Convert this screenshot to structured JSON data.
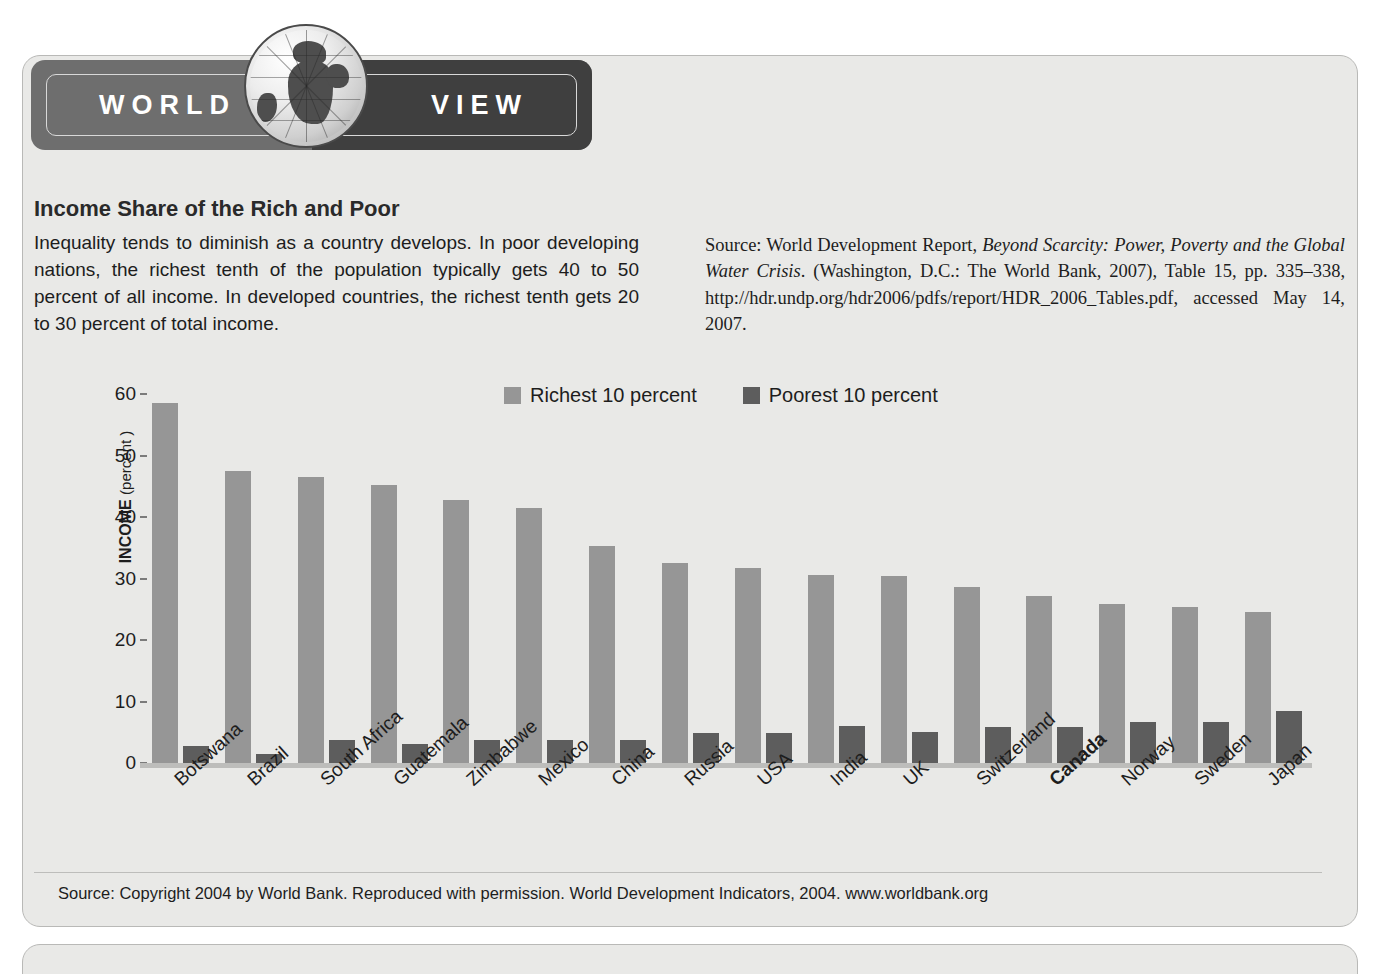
{
  "banner": {
    "word_left": "WORLD",
    "word_right": "VIEW",
    "globe_icon": "globe-icon"
  },
  "article": {
    "title": "Income Share of the Rich and Poor",
    "intro": "Inequality tends to diminish as a country develops. In poor developing nations, the richest tenth of the population typically gets 40 to 50 percent of all income. In developed countries, the richest tenth gets 20 to 30 percent of total income.",
    "source_parts": {
      "lead": "Source: World Development Report, ",
      "italic_title": "Beyond Scarcity: Power, Poverty and the Global Water Crisis",
      "tail": ". (Washington, D.C.: The World Bank, 2007), Table 15, pp. 335–338, http://hdr.undp.org/hdr2006/pdfs/report/HDR_2006_Tables.pdf, accessed May 14, 2007."
    }
  },
  "footer": {
    "source": "Source: Copyright 2004 by World Bank. Reproduced with permission. World Development Indicators, 2004. www.worldbank.org"
  },
  "colors": {
    "rich_bar": "#969696",
    "poor_bar": "#5d5d5d",
    "panel_bg": "#e9e9e7",
    "banner_left": "#6e6e6e",
    "banner_right": "#3f3f3f"
  },
  "chart_data": {
    "type": "bar",
    "title": "",
    "xlabel": "",
    "ylabel": "INCOME (percent)",
    "ylabel_main": "INCOME",
    "ylabel_unit": "(percent )",
    "ylim": [
      0,
      60
    ],
    "yticks": [
      60,
      50,
      40,
      30,
      20,
      10,
      0
    ],
    "grid": false,
    "legend_position": "top-center",
    "categories": [
      "Botswana",
      "Brazil",
      "South Africa",
      "Guatemala",
      "Zimbabwe",
      "Mexico",
      "China",
      "Russia",
      "USA",
      "India",
      "UK",
      "Switzerland",
      "Canada",
      "Norway",
      "Sweden",
      "Japan"
    ],
    "highlighted_category": "Canada",
    "series": [
      {
        "name": "Richest 10 percent",
        "color": "#969696",
        "values": [
          58.5,
          47.5,
          46.5,
          45.2,
          42.8,
          41.5,
          35.3,
          32.5,
          31.7,
          30.5,
          30.4,
          28.7,
          27.2,
          25.9,
          25.3,
          24.5
        ]
      },
      {
        "name": "Poorest 10 percent",
        "color": "#5d5d5d",
        "values": [
          2.8,
          1.5,
          3.8,
          3.1,
          3.8,
          3.8,
          3.8,
          4.8,
          4.9,
          6.1,
          5.1,
          5.8,
          5.8,
          6.7,
          6.6,
          8.5
        ]
      }
    ]
  }
}
